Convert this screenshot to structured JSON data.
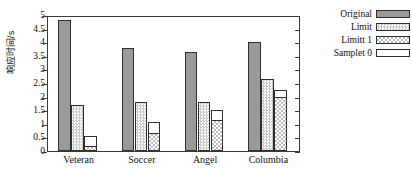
{
  "chart_data": {
    "type": "bar",
    "title": "",
    "xlabel": "",
    "ylabel": "响应时间/s",
    "ylim": [
      0,
      5
    ],
    "ytick_labels": [
      "0",
      "0.5",
      "1",
      "1.5",
      "2",
      "2.5",
      "3",
      "3.5",
      "4",
      "4.5",
      "5"
    ],
    "grid": false,
    "legend_position": "right-outside",
    "categories": [
      "Veteran",
      "Soccer",
      "Angel",
      "Columbia"
    ],
    "series": [
      {
        "name": "Original",
        "fill": "solid",
        "values": [
          4.8,
          3.8,
          3.65,
          4.0
        ]
      },
      {
        "name": "Limit",
        "fill": "dotted",
        "values": [
          1.7,
          1.8,
          1.8,
          2.65
        ]
      },
      {
        "name": "Limitt 1",
        "fill": "crosshatch",
        "values": [
          0.2,
          0.65,
          1.15,
          2.0
        ]
      },
      {
        "name": "Samplet 0",
        "fill": "white",
        "values": [
          0.55,
          1.05,
          1.5,
          2.25
        ]
      }
    ]
  },
  "legend": {
    "items": [
      {
        "label": "Original"
      },
      {
        "label": "Limit"
      },
      {
        "label": "Limitt 1"
      },
      {
        "label": "Samplet 0"
      }
    ]
  },
  "colors": {
    "solid_fill": "#9a9a9a",
    "outline": "#2f2f2f",
    "axis": "#3a3a3a",
    "background": "#ffffff"
  }
}
